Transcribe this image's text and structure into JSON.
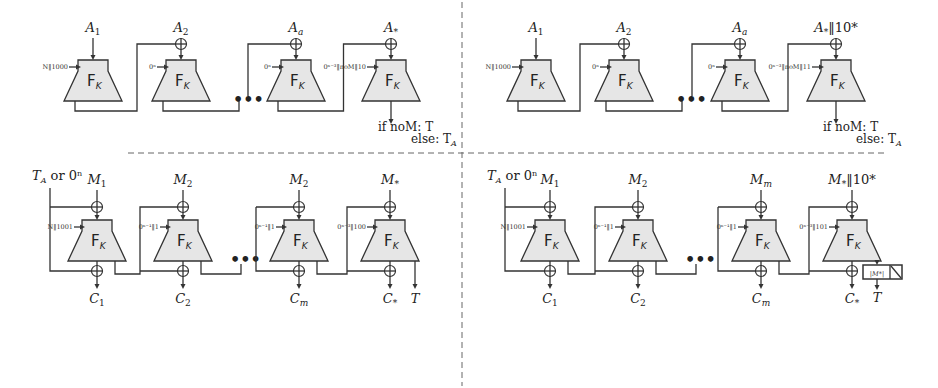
{
  "block_label": "F",
  "block_subscript": "K",
  "ellipsis": "•••",
  "panels": {
    "top_left": {
      "inputs": [
        "A",
        "A",
        "A",
        "A"
      ],
      "input_subs": [
        "1",
        "2",
        "a",
        "*"
      ],
      "input_suffix": [
        "",
        "",
        "",
        ""
      ],
      "tweaks": [
        "N‖1000",
        "0ⁿ",
        "0ⁿ",
        "0ⁿ⁻³‖noM‖10"
      ],
      "output_line1": "if noM: T",
      "output_line2": "else: T",
      "output_line2_sub": "A"
    },
    "top_right": {
      "inputs": [
        "A",
        "A",
        "A",
        "A"
      ],
      "input_subs": [
        "1",
        "2",
        "a",
        "*"
      ],
      "input_suffix": [
        "",
        "",
        "",
        "‖10*"
      ],
      "tweaks": [
        "N‖1000",
        "0ⁿ",
        "0ⁿ",
        "0ⁿ⁻³‖noM‖11"
      ],
      "output_line1": "if noM: T",
      "output_line2": "else: T",
      "output_line2_sub": "A"
    },
    "bottom_left": {
      "init_label": "T",
      "init_sub": "A",
      "init_rest": " or 0ⁿ",
      "inputs": [
        "M",
        "M",
        "M",
        "M"
      ],
      "input_subs": [
        "1",
        "2",
        "2",
        "*"
      ],
      "input_suffix": [
        "",
        "",
        "",
        ""
      ],
      "tweaks": [
        "N‖1001",
        "0ⁿ⁻¹‖1",
        "0ⁿ⁻¹‖1",
        "0ⁿ⁻³‖100"
      ],
      "outputs": [
        "C",
        "C",
        "C",
        "C"
      ],
      "output_subs": [
        "1",
        "2",
        "m",
        "*"
      ],
      "tag": "T"
    },
    "bottom_right": {
      "init_label": "T",
      "init_sub": "A",
      "init_rest": " or 0ⁿ",
      "inputs": [
        "M",
        "M",
        "M",
        "M"
      ],
      "input_subs": [
        "1",
        "2",
        "m",
        "*"
      ],
      "input_suffix": [
        "",
        "",
        "",
        "‖10*"
      ],
      "tweaks": [
        "N‖1001",
        "0ⁿ⁻¹‖1",
        "0ⁿ⁻¹‖1",
        "0ⁿ⁻³‖101"
      ],
      "outputs": [
        "C",
        "C",
        "C",
        "C"
      ],
      "output_subs": [
        "1",
        "2",
        "m",
        "*"
      ],
      "truncate_label": "|M*|",
      "tag": "T"
    }
  }
}
